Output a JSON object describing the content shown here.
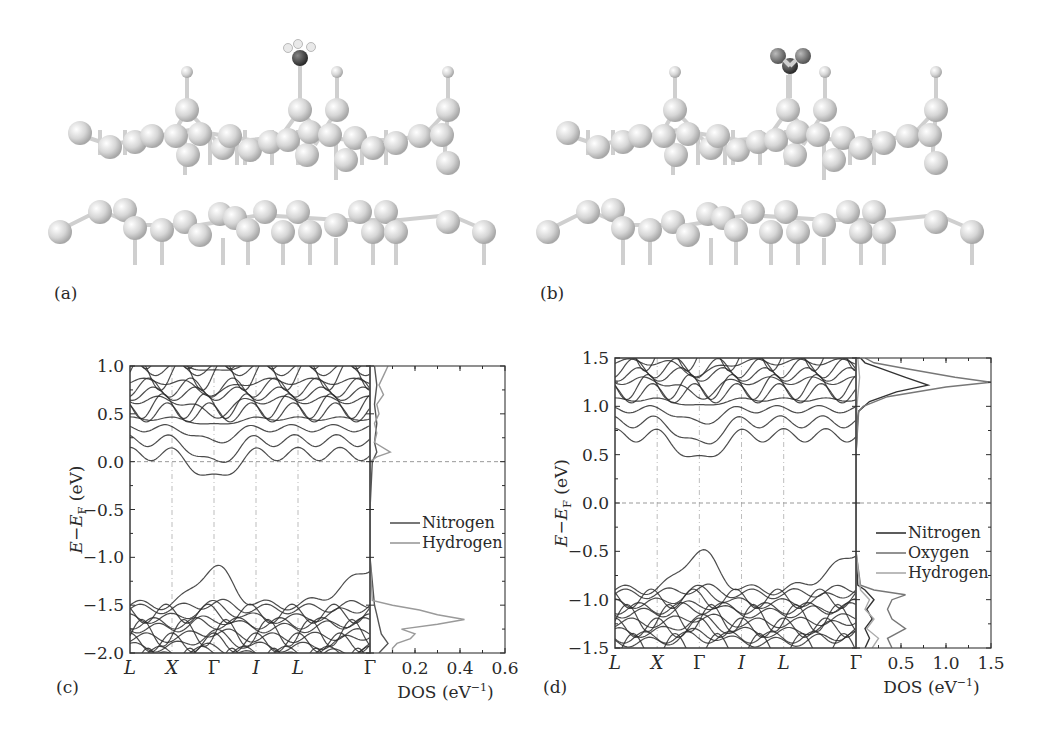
{
  "figure": {
    "panels": {
      "a": {
        "label": "(a)",
        "adsorbate": "NH3"
      },
      "b": {
        "label": "(b)",
        "adsorbate": "NO2"
      },
      "c": {
        "label": "(c)"
      },
      "d": {
        "label": "(d)"
      }
    }
  },
  "chart_data": [
    {
      "panel": "(c)",
      "type": "line",
      "subplot": "band_structure",
      "title": "",
      "xlabel": "",
      "ylabel": "E−E_F (eV)",
      "ylabel_display": "E−EF (eV)",
      "ylim": [
        -2.0,
        1.0
      ],
      "yticks": [
        1.0,
        0.5,
        0.0,
        -0.5,
        -1.0,
        -1.5,
        -2.0
      ],
      "ytick_labels": [
        "1.0",
        "0.5",
        "0.0",
        "−0.5",
        "−1.0",
        "−1.5",
        "−2.0"
      ],
      "kpoints": [
        "L",
        "X",
        "Γ",
        "I",
        "L",
        "Γ"
      ],
      "kpoint_positions": [
        0,
        0.175,
        0.35,
        0.525,
        0.7,
        1.0
      ],
      "fermi_level": 0.0,
      "band_features": {
        "conduction_band_min": -0.1,
        "conduction_band_min_at": "Γ",
        "valence_band_max": -1.12,
        "valence_band_max_at": "Γ"
      }
    },
    {
      "panel": "(c)",
      "type": "line",
      "subplot": "DOS",
      "xlabel": "DOS (eV⁻¹)",
      "xlim": [
        0,
        0.6
      ],
      "xticks": [
        0.2,
        0.4,
        0.6
      ],
      "xtick_labels": [
        "0.2",
        "0.4",
        "0.6"
      ],
      "legend": [
        "Nitrogen",
        "Hydrogen"
      ],
      "legend_position": "center-right",
      "series": [
        {
          "name": "Nitrogen",
          "color": "#555555",
          "E": [
            1.0,
            0.8,
            0.6,
            0.4,
            0.2,
            0.1,
            0.0,
            -0.5,
            -1.0,
            -1.5,
            -1.6,
            -1.7,
            -1.8,
            -1.9,
            -2.0
          ],
          "dos": [
            0.02,
            0.03,
            0.02,
            0.03,
            0.02,
            0.03,
            0.01,
            0.0,
            0.0,
            0.02,
            0.03,
            0.04,
            0.05,
            0.08,
            0.04
          ]
        },
        {
          "name": "Hydrogen",
          "color": "#9a9a9a",
          "E": [
            1.0,
            0.9,
            0.8,
            0.7,
            0.6,
            0.5,
            0.4,
            0.3,
            0.2,
            0.1,
            0.05,
            0.0,
            -0.5,
            -1.0,
            -1.45,
            -1.5,
            -1.55,
            -1.6,
            -1.65,
            -1.7,
            -1.75,
            -1.8,
            -1.85,
            -1.9,
            -1.95,
            -2.0
          ],
          "dos": [
            0.08,
            0.06,
            0.04,
            0.06,
            0.03,
            0.04,
            0.02,
            0.03,
            0.02,
            0.09,
            0.03,
            0.0,
            0.0,
            0.0,
            0.01,
            0.1,
            0.22,
            0.3,
            0.42,
            0.3,
            0.14,
            0.2,
            0.18,
            0.12,
            0.1,
            0.1
          ]
        }
      ]
    },
    {
      "panel": "(d)",
      "type": "line",
      "subplot": "band_structure",
      "ylabel": "E−E_F (eV)",
      "ylabel_display": "E−EF (eV)",
      "ylim": [
        -1.5,
        1.5
      ],
      "yticks": [
        1.5,
        1.0,
        0.5,
        0.0,
        -0.5,
        -1.0,
        -1.5
      ],
      "ytick_labels": [
        "1.5",
        "1.0",
        "0.5",
        "0.0",
        "−0.5",
        "−1.0",
        "−1.5"
      ],
      "kpoints": [
        "L",
        "X",
        "Γ",
        "I",
        "L",
        "Γ"
      ],
      "kpoint_positions": [
        0,
        0.175,
        0.35,
        0.525,
        0.7,
        1.0
      ],
      "fermi_level": 0.0,
      "band_features": {
        "conduction_band_min": 0.52,
        "conduction_band_min_at": "Γ",
        "valence_band_max": -0.52,
        "valence_band_max_at": "Γ"
      }
    },
    {
      "panel": "(d)",
      "type": "line",
      "subplot": "DOS",
      "xlabel": "DOS (eV⁻¹)",
      "xlim": [
        0,
        1.5
      ],
      "xticks": [
        0.5,
        1.0,
        1.5
      ],
      "xtick_labels": [
        "0.5",
        "1.0",
        "1.5"
      ],
      "legend": [
        "Nitrogen",
        "Oxygen",
        "Hydrogen"
      ],
      "legend_position": "center-right",
      "series": [
        {
          "name": "Nitrogen",
          "color": "#333333",
          "E": [
            1.5,
            1.45,
            1.4,
            1.3,
            1.22,
            1.15,
            1.05,
            0.95,
            0.9,
            0.5,
            0.0,
            -0.5,
            -0.85,
            -0.9,
            -1.0,
            -1.1,
            -1.2,
            -1.3,
            -1.4,
            -1.5
          ],
          "dos": [
            0.05,
            0.1,
            0.25,
            0.55,
            0.8,
            0.45,
            0.15,
            0.03,
            0.02,
            0.0,
            0.0,
            0.0,
            0.02,
            0.1,
            0.2,
            0.12,
            0.18,
            0.1,
            0.15,
            0.1
          ]
        },
        {
          "name": "Oxygen",
          "color": "#777777",
          "E": [
            1.5,
            1.45,
            1.4,
            1.3,
            1.25,
            1.2,
            1.1,
            1.0,
            0.95,
            0.5,
            0.0,
            -0.5,
            -0.85,
            -0.9,
            -0.95,
            -1.0,
            -1.1,
            -1.2,
            -1.3,
            -1.4,
            -1.5
          ],
          "dos": [
            0.1,
            0.2,
            0.5,
            1.1,
            1.5,
            1.0,
            0.35,
            0.08,
            0.03,
            0.0,
            0.0,
            0.0,
            0.05,
            0.2,
            0.55,
            0.4,
            0.35,
            0.4,
            0.55,
            0.35,
            0.4
          ]
        },
        {
          "name": "Hydrogen",
          "color": "#aaaaaa",
          "E": [
            1.5,
            1.3,
            1.2,
            1.0,
            0.5,
            0.0,
            -0.5,
            -0.9,
            -1.0,
            -1.1,
            -1.2,
            -1.3,
            -1.4,
            -1.5
          ],
          "dos": [
            0.02,
            0.04,
            0.03,
            0.01,
            0.0,
            0.0,
            0.0,
            0.05,
            0.15,
            0.1,
            0.2,
            0.12,
            0.25,
            0.18
          ]
        }
      ]
    }
  ]
}
